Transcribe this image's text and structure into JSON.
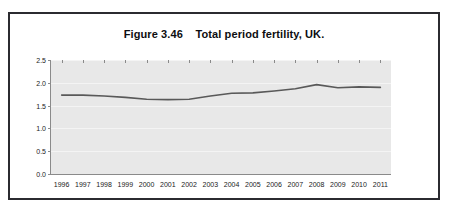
{
  "figure": {
    "title": "Figure 3.46    Total period fertility, UK.",
    "frame_border_color": "#2b2b30",
    "background_color": "#ffffff"
  },
  "chart_data": {
    "type": "line",
    "title": "Figure 3.46    Total period fertility, UK.",
    "xlabel": "",
    "ylabel": "",
    "categories": [
      "1996",
      "1997",
      "1998",
      "1999",
      "2000",
      "2001",
      "2002",
      "2003",
      "2004",
      "2005",
      "2006",
      "2007",
      "2008",
      "2009",
      "2010",
      "2011"
    ],
    "values": [
      1.73,
      1.73,
      1.71,
      1.68,
      1.64,
      1.63,
      1.64,
      1.71,
      1.77,
      1.78,
      1.82,
      1.87,
      1.96,
      1.89,
      1.91,
      1.9
    ],
    "series": [
      {
        "name": "Total period fertility rate",
        "values": [
          1.73,
          1.73,
          1.71,
          1.68,
          1.64,
          1.63,
          1.64,
          1.71,
          1.77,
          1.78,
          1.82,
          1.87,
          1.96,
          1.89,
          1.91,
          1.9
        ],
        "color": "#595959"
      }
    ],
    "ylim": [
      0.0,
      2.5
    ],
    "yticks": [
      "0.0",
      "0.5",
      "1.0",
      "1.5",
      "2.0",
      "2.5"
    ],
    "ytick_values": [
      0.0,
      0.5,
      1.0,
      1.5,
      2.0,
      2.5
    ],
    "grid": true,
    "grid_color": "#f4f4f4",
    "legend": false,
    "legend_position": "none",
    "plot_background": "#e8e8e8",
    "axis_color": "#8a8a8a",
    "line_color": "#595959",
    "line_width": 1.6,
    "markers": false
  }
}
